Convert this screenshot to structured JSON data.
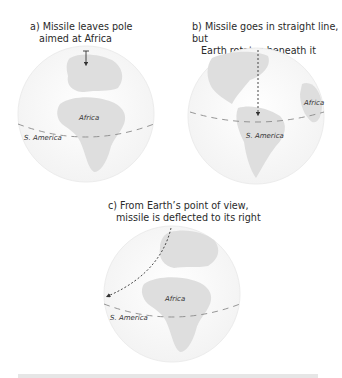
{
  "panels": [
    {
      "id": "a",
      "caption_line1": "a) Missile leaves pole",
      "caption_line2": "aimed at Africa",
      "labels": {
        "africa": "Africa",
        "s_america": "S. America"
      }
    },
    {
      "id": "b",
      "caption_line1": "b) Missile goes in straight line, but",
      "caption_line2": "Earth rotates beneath it",
      "labels": {
        "africa": "Africa",
        "s_america": "S. America"
      }
    },
    {
      "id": "c",
      "caption_line1": "c) From Earth’s point of view,",
      "caption_line2": "missile is deflected to its right",
      "labels": {
        "africa": "Africa",
        "s_america": "S. America"
      }
    }
  ],
  "colors": {
    "globe_fill": "#fbfbfb",
    "globe_edge": "#ececec",
    "land": "#dcdcdc",
    "equator": "#8a8a8a",
    "trajectory": "#333333",
    "text": "#2a2a2a"
  }
}
